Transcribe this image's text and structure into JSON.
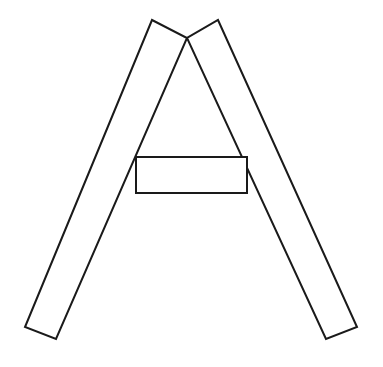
{
  "canvas": {
    "width": 383,
    "height": 367,
    "background_color": "#ffffff",
    "stroke_color": "#1a1a1a",
    "fill_color": "#ffffff",
    "stroke_width": 2,
    "description": "Line drawing of the capital letter A formed by two crossed quadrilateral strips and a rectangular crossbar"
  },
  "shapes": [
    {
      "name": "left-strip",
      "type": "quadrilateral",
      "description": "Long slanted bar running from upper-right apex down to lower-left",
      "points": "152,20 187,38 56,339 25,327",
      "vertices": [
        {
          "label": "top-left",
          "x": 152,
          "y": 20
        },
        {
          "label": "top-right-apex",
          "x": 187,
          "y": 38
        },
        {
          "label": "bottom-right",
          "x": 56,
          "y": 339
        },
        {
          "label": "bottom-left",
          "x": 25,
          "y": 327
        }
      ]
    },
    {
      "name": "right-strip",
      "type": "quadrilateral",
      "description": "Long slanted bar running from upper-left apex down to lower-right",
      "points": "218,20 357,327 326,339 187,38",
      "vertices": [
        {
          "label": "top-right",
          "x": 218,
          "y": 20
        },
        {
          "label": "bottom-right",
          "x": 357,
          "y": 327
        },
        {
          "label": "bottom-left",
          "x": 326,
          "y": 339
        },
        {
          "label": "top-left-apex",
          "x": 187,
          "y": 38
        }
      ]
    },
    {
      "name": "crossbar-rectangle",
      "type": "rectangle",
      "description": "Horizontal rectangle forming the crossbar of the letter A",
      "points": "136,157 247,157 247,193 136,193",
      "x": 136,
      "y": 157,
      "width": 111,
      "height": 36
    }
  ],
  "apex": {
    "label": "crossing-point",
    "x": 187,
    "y": 38
  }
}
